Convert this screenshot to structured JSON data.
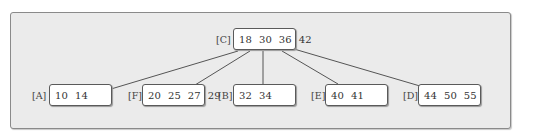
{
  "diagram": {
    "type": "b-tree",
    "root": {
      "label": "[C]",
      "keys": "18  30  36  42"
    },
    "children": [
      {
        "label": "[A]",
        "keys": "10  14"
      },
      {
        "label": "[F]",
        "keys": "20  25  27  29"
      },
      {
        "label": "[B]",
        "keys": "32  34"
      },
      {
        "label": "[E]",
        "keys": "40  41"
      },
      {
        "label": "[D]",
        "keys": "44  50  55"
      }
    ]
  },
  "colors": {
    "background": "#ebebeb",
    "node_fill": "#ffffff",
    "node_border": "#5a5a5a",
    "edge": "#555555"
  }
}
